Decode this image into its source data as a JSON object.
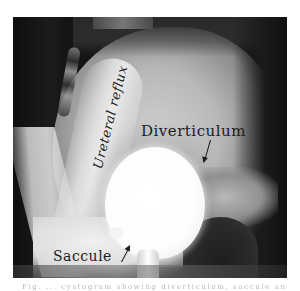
{
  "figure": {
    "annotations": {
      "diverticulum": "Diverticulum",
      "saccule": "Saccule",
      "ureteral_reflux": "Ureteral reflux"
    }
  },
  "caption": {
    "text": "Fig. ... cystogram showing diverticulum, saccule and ureteral reflux"
  }
}
